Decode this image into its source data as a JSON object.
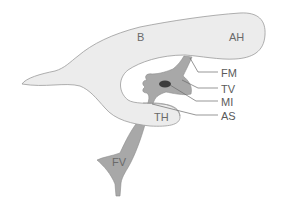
{
  "diagram": {
    "colors": {
      "lateral_ventricle_fill": "#ececec",
      "lateral_ventricle_stroke": "#9a9a9a",
      "third_ventricle_fill": "#a8a8a8",
      "massa_intermedia_fill": "#3c3c3c",
      "leader_line": "#6a6a6a",
      "label_text": "#5a5a5a"
    },
    "labels": {
      "B": "B",
      "AH": "AH",
      "FM": "FM",
      "TV": "TV",
      "MI": "MI",
      "AS": "AS",
      "TH": "TH",
      "FV": "FV"
    }
  }
}
